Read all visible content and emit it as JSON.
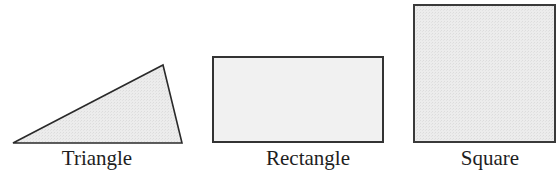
{
  "figure": {
    "shapes": [
      {
        "type": "triangle",
        "label": "Triangle",
        "points": "13,143 163,65 182,143"
      },
      {
        "type": "rectangle",
        "label": "Rectangle",
        "x": 213,
        "y": 57,
        "width": 170,
        "height": 85
      },
      {
        "type": "square",
        "label": "Square",
        "x": 414,
        "y": 5,
        "width": 141,
        "height": 137
      }
    ],
    "colors": {
      "fill": "#ececec",
      "stroke": "#2a2a2a",
      "text": "#1e1e1e"
    }
  }
}
